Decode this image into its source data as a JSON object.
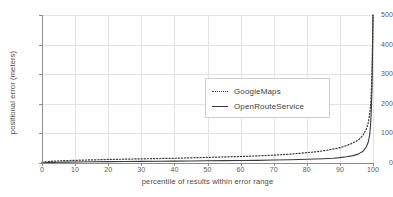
{
  "chart_data": {
    "type": "line",
    "title": "",
    "xlabel": "percentile of results within error range",
    "ylabel": "positional error (meters)",
    "xlim": [
      0,
      100
    ],
    "ylim": [
      0,
      500
    ],
    "xticks": [
      0,
      10,
      20,
      30,
      40,
      50,
      60,
      70,
      80,
      90,
      100
    ],
    "yticks": [
      0,
      100,
      200,
      300,
      400,
      500
    ],
    "grid": true,
    "legend_position": "center",
    "series": [
      {
        "name": "GoogleMaps",
        "style": "dotted",
        "color": "#3a3a3a",
        "x": [
          0,
          1,
          2,
          3,
          5,
          7,
          10,
          13,
          15,
          20,
          25,
          30,
          35,
          40,
          45,
          50,
          55,
          60,
          65,
          70,
          75,
          80,
          83,
          86,
          89,
          91,
          93,
          95,
          96,
          97,
          98,
          98.5,
          99,
          99.3,
          99.5,
          99.7,
          99.85,
          100
        ],
        "y": [
          2,
          4,
          5,
          6,
          7,
          8,
          9,
          10,
          10.5,
          12,
          13,
          14,
          15,
          16,
          17.5,
          19,
          20.5,
          22,
          24,
          26.5,
          30,
          35,
          38,
          43,
          49,
          55,
          63,
          74,
          82,
          94,
          115,
          132,
          165,
          200,
          245,
          310,
          400,
          500
        ]
      },
      {
        "name": "OpenRouteService",
        "style": "solid",
        "color": "#3a3a3a",
        "x": [
          0,
          1,
          2,
          3,
          5,
          7,
          10,
          15,
          20,
          25,
          30,
          35,
          40,
          45,
          50,
          55,
          60,
          65,
          70,
          75,
          80,
          85,
          88,
          90,
          92,
          94,
          95.5,
          97,
          98,
          98.6,
          99,
          99.3,
          99.5,
          99.7,
          99.85,
          100
        ],
        "y": [
          0.5,
          1,
          1.5,
          2,
          2.5,
          3,
          3.5,
          4,
          4.5,
          5,
          5.5,
          6,
          6.5,
          7,
          7.5,
          8,
          8.5,
          9,
          10,
          11,
          12.5,
          14.5,
          16,
          18,
          21,
          25,
          30,
          40,
          55,
          72,
          95,
          135,
          180,
          255,
          370,
          500
        ]
      }
    ]
  },
  "axes": {
    "ylabel": "positional error (meters)",
    "xlabel": "percentile of results within error range",
    "ytick_labels": [
      "500",
      "400",
      "300",
      "200",
      "100",
      "0"
    ],
    "xtick_labels": [
      "0",
      "10",
      "20",
      "30",
      "40",
      "50",
      "60",
      "70",
      "80",
      "90",
      "100"
    ]
  },
  "legend": {
    "items": [
      {
        "label": "GoogleMaps",
        "style": "dotted"
      },
      {
        "label": "OpenRouteService",
        "style": "solid"
      }
    ]
  }
}
